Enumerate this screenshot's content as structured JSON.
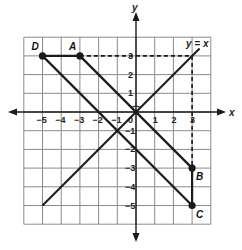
{
  "diagram": {
    "type": "coordinate-plane",
    "axes": {
      "x_label": "x",
      "y_label": "y",
      "x_range": [
        -6,
        4
      ],
      "y_range": [
        -6,
        4
      ],
      "x_ticks": [
        "−5",
        "−4",
        "−3",
        "−2",
        "−1",
        "0",
        "1",
        "2",
        "3"
      ],
      "y_ticks_pos": [
        "1",
        "2",
        "3"
      ],
      "y_ticks_neg": [
        "−1",
        "−2",
        "−3",
        "−4",
        "−5"
      ]
    },
    "points": [
      {
        "label": "D",
        "x": -5,
        "y": 3
      },
      {
        "label": "A",
        "x": -3,
        "y": 3
      },
      {
        "label": "B",
        "x": 3,
        "y": -3
      },
      {
        "label": "C",
        "x": 3,
        "y": -5
      }
    ],
    "segments": [
      {
        "from": "D",
        "to": "A",
        "style": "solid"
      },
      {
        "from": "A",
        "to": "B",
        "style": "solid"
      },
      {
        "from": "D",
        "to": "C",
        "style": "solid"
      },
      {
        "from": "B",
        "to": "C",
        "style": "solid"
      }
    ],
    "reflection_line": {
      "label": "y = x",
      "from": [
        -5,
        -5
      ],
      "to": [
        3.4,
        3.4
      ]
    },
    "dashed_guides": [
      {
        "from": [
          -3,
          3
        ],
        "to": [
          3,
          3
        ]
      },
      {
        "from": [
          3,
          3
        ],
        "to": [
          3,
          -3
        ]
      }
    ],
    "right_angle_marker": {
      "at": [
        0,
        0
      ]
    },
    "colors": {
      "grid": "#8a8a8a",
      "lines": "#1a1a1a",
      "background": "#ffffff"
    }
  }
}
